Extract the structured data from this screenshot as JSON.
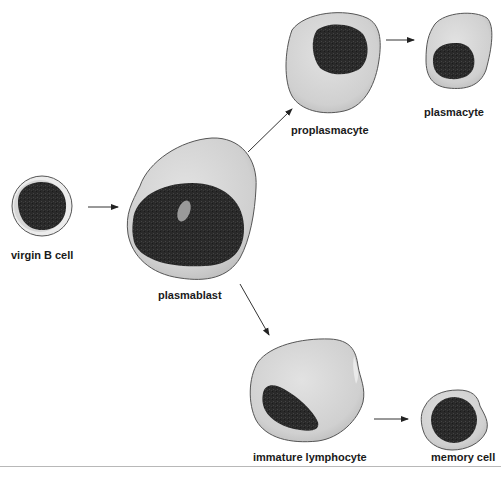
{
  "cells": [
    {
      "id": "virgin-b-cell",
      "label": "virgin B cell"
    },
    {
      "id": "plasmablast",
      "label": "plasmablast"
    },
    {
      "id": "proplasmacyte",
      "label": "proplasmacyte"
    },
    {
      "id": "plasmacyte",
      "label": "plasmacyte"
    },
    {
      "id": "immature-lymphocyte",
      "label": "immature lymphocyte"
    },
    {
      "id": "memory-cell",
      "label": "memory cell"
    }
  ],
  "arrows": [
    {
      "from": "virgin B cell",
      "to": "plasmablast"
    },
    {
      "from": "plasmablast",
      "to": "proplasmacyte"
    },
    {
      "from": "proplasmacyte",
      "to": "plasmacyte"
    },
    {
      "from": "plasmablast",
      "to": "immature lymphocyte"
    },
    {
      "from": "immature lymphocyte",
      "to": "memory cell"
    }
  ],
  "colors": {
    "cytoplasm": "#d4d4d4",
    "nucleus": "#2a2a2a",
    "outline": "#555555",
    "nucleolus": "#9a9a9a"
  }
}
